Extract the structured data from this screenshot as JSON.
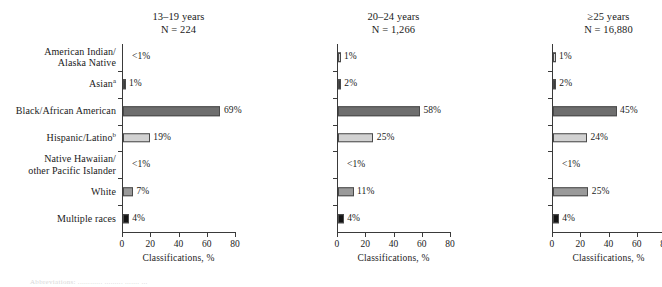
{
  "chart_data": {
    "type": "bar",
    "orientation": "horizontal",
    "title": "",
    "xlabel": "Classifications, %",
    "ylabel": "",
    "xlim": [
      0,
      80
    ],
    "xticks": [
      0,
      20,
      40,
      60,
      80
    ],
    "grid": false,
    "legend": "none",
    "categories": [
      "American Indian/\nAlaska Native",
      "Asian",
      "Black/African American",
      "Hispanic/Latino",
      "Native Hawaiian/\nother Pacific Islander",
      "White",
      "Multiple races"
    ],
    "category_footnotes": [
      "",
      "a",
      "",
      "b",
      "",
      "",
      ""
    ],
    "panels": [
      {
        "title": "13–19 years\nN = 224",
        "age_group": "13–19 years",
        "n_label": "N = 224",
        "values": [
          0.4,
          1,
          69,
          19,
          0.3,
          7,
          4
        ],
        "value_labels": [
          "<1%",
          "1%",
          "69%",
          "19%",
          "<1%",
          "7%",
          "4%"
        ],
        "suppressed": [
          true,
          false,
          false,
          false,
          true,
          false,
          false
        ]
      },
      {
        "title": "20–24 years\nN = 1,266",
        "age_group": "20–24 years",
        "n_label": "N = 1,266",
        "values": [
          1,
          2,
          58,
          25,
          0.3,
          11,
          4
        ],
        "value_labels": [
          "1%",
          "2%",
          "58%",
          "25%",
          "<1%",
          "11%",
          "4%"
        ],
        "suppressed": [
          false,
          false,
          false,
          false,
          true,
          false,
          false
        ]
      },
      {
        "title": "≥25 years\nN = 16,880",
        "age_group": "≥25 years",
        "n_label": "N = 16,880",
        "values": [
          1,
          2,
          45,
          24,
          0.3,
          25,
          4
        ],
        "value_labels": [
          "1%",
          "2%",
          "45%",
          "24%",
          "<1%",
          "25%",
          "4%"
        ],
        "suppressed": [
          false,
          false,
          false,
          false,
          true,
          false,
          false
        ]
      }
    ],
    "bar_colors": [
      "#d9d9d9",
      "#3b3b3b",
      "#6e6e6e",
      "#d2d2d2",
      "#d9d9d9",
      "#9a9a9a",
      "#141414"
    ],
    "axis_color": "#3a3a3a"
  },
  "cut_footnote": "Abbreviations: ............ ......... .......  ..."
}
